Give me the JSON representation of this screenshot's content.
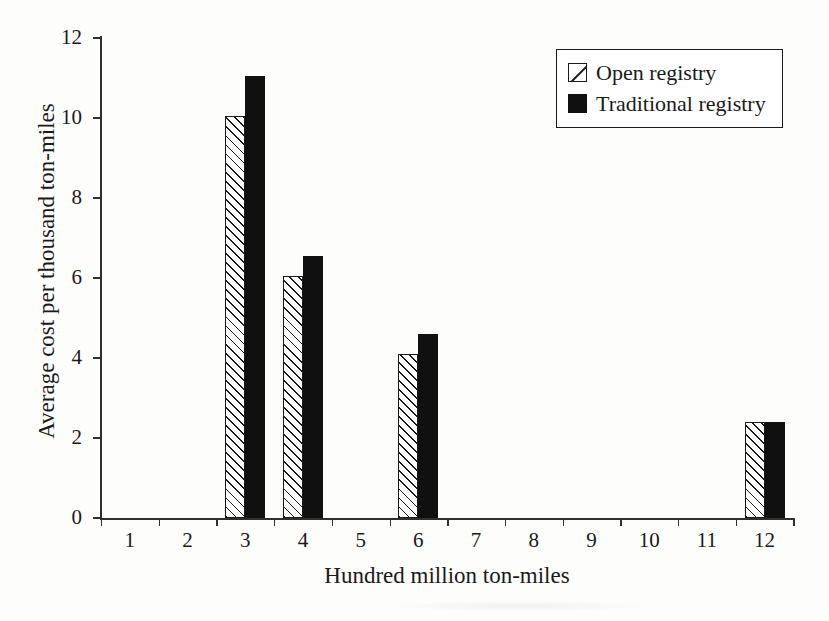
{
  "chart_data": {
    "type": "bar",
    "title": "",
    "xlabel": "Hundred million ton-miles",
    "ylabel": "Average cost per thousand ton-miles",
    "categories": [
      "1",
      "2",
      "3",
      "4",
      "5",
      "6",
      "7",
      "8",
      "9",
      "10",
      "11",
      "12"
    ],
    "xlim": [
      0,
      12
    ],
    "ylim": [
      0,
      12
    ],
    "yticks": [
      "0",
      "2",
      "4",
      "6",
      "8",
      "10",
      "12"
    ],
    "grid": false,
    "legend_position": "top-right",
    "series": [
      {
        "name": "Open registry",
        "style": "hatched",
        "values": [
          null,
          null,
          10.05,
          6.05,
          null,
          4.1,
          null,
          null,
          null,
          null,
          null,
          2.4
        ]
      },
      {
        "name": "Traditional registry",
        "style": "solid-black",
        "values": [
          null,
          null,
          11.05,
          6.55,
          null,
          4.6,
          null,
          null,
          null,
          null,
          null,
          2.4
        ]
      }
    ]
  },
  "legend": {
    "items": [
      {
        "label": "Open registry",
        "swatch": "hatched-square-icon"
      },
      {
        "label": "Traditional registry",
        "swatch": "filled-square-icon"
      }
    ]
  },
  "axes": {
    "y_title": "Average cost per thousand ton-miles",
    "x_title": "Hundred million ton-miles"
  },
  "colors": {
    "ink": "#1a1a1a",
    "bar_solid": "#101010",
    "bar_open_fill": "#ffffff",
    "background": "#fdfdfc"
  }
}
